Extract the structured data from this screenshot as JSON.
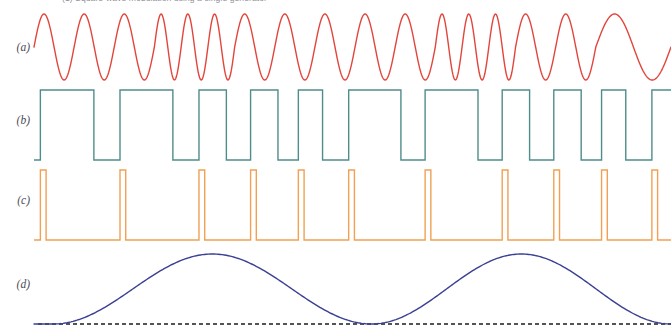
{
  "figure": {
    "clipped_top_caption": "(1)  Square-wave modulation using a single generator",
    "background_color": "#ffffff",
    "width": 671,
    "height": 330
  },
  "traces": [
    {
      "id": "a",
      "label": "(a)",
      "name": "fsk-carrier-waveform",
      "color": "#e2453c",
      "type": "sine-fsk",
      "stroke_width": 1.4,
      "label_x": 14,
      "label_y": 41,
      "row_top": 8,
      "row_height": 78
    },
    {
      "id": "b",
      "label": "(b)",
      "name": "square-wave-data-signal",
      "color": "#4f8d8b",
      "type": "square",
      "stroke_width": 1.4,
      "label_x": 14,
      "label_y": 121,
      "row_top": 86,
      "row_height": 78
    },
    {
      "id": "c",
      "label": "(c)",
      "name": "clock-spike-pulse-train",
      "color": "#f0a154",
      "type": "narrow-pulse",
      "stroke_width": 1.4,
      "label_x": 14,
      "label_y": 201,
      "row_top": 166,
      "row_height": 78
    },
    {
      "id": "d",
      "label": "(d)",
      "name": "raised-cosine-envelope",
      "color": "#3b4093",
      "baseline_color": "#1d1d1d",
      "baseline_style": "dashed",
      "type": "raised-cosine",
      "stroke_width": 1.4,
      "label_x": 14,
      "label_y": 285,
      "row_top": 246,
      "row_height": 84
    }
  ],
  "chart_data": {
    "type": "line",
    "title": "",
    "xlabel": "",
    "ylabel": "",
    "grid": false,
    "legend": "none",
    "x_range": [
      0,
      100
    ],
    "series": [
      {
        "name": "(a) FSK carrier",
        "color": "#e2453c",
        "type": "sine-fsk",
        "description": "Sinusoidal carrier whose instantaneous frequency steps between a low and a high value; amplitude constant",
        "amplitude": 1.0,
        "segment_cycles": [
          1.0,
          1.0,
          1.0,
          1.5,
          1.5,
          1.0,
          1.0,
          1.0,
          1.0,
          1.0,
          1.5,
          1.5,
          1.0,
          1.0,
          1.0
        ],
        "segment_boundaries_pct": [
          0,
          6.3,
          12.6,
          18.9,
          25.2,
          31.5,
          37.8,
          44.1,
          50.4,
          56.7,
          63.0,
          69.3,
          75.6,
          81.9,
          88.2,
          100
        ],
        "peaks_count": 16,
        "ylim": [
          -1,
          1
        ]
      },
      {
        "name": "(b) Square-wave data",
        "color": "#4f8d8b",
        "type": "square",
        "description": "Binary NRZ square wave; high and low intervals of varying width corresponding to the data bits",
        "levels": [
          0,
          1
        ],
        "ylim": [
          0,
          1
        ],
        "transitions_pct": [
          1.0,
          9.4,
          13.5,
          21.8,
          25.9,
          30.2,
          34.0,
          38.3,
          41.5,
          45.3,
          49.4,
          57.6,
          61.4,
          69.7,
          73.5,
          77.8,
          81.6,
          85.9,
          89.1,
          92.9,
          97.0
        ],
        "pulse_widths_pct": [
          8.4,
          4.1,
          8.3,
          4.1,
          4.3,
          3.8,
          4.3,
          3.2,
          3.8,
          4.1,
          8.2,
          3.8,
          8.3,
          3.8,
          4.3,
          3.8,
          4.3,
          3.2,
          3.8,
          4.1,
          3.0
        ],
        "bit_sequence": [
          1,
          0,
          1,
          0,
          1,
          0,
          1,
          0,
          1,
          0,
          1,
          0,
          1,
          0,
          1,
          0,
          1,
          0,
          1,
          0,
          1
        ]
      },
      {
        "name": "(c) Clock spikes",
        "color": "#f0a154",
        "type": "narrow-pulse",
        "description": "Very narrow positive pulses aligned with the rising edges of trace (b); used as sampling or trigger instants",
        "levels": [
          0,
          1
        ],
        "ylim": [
          0,
          1
        ],
        "pulse_width_pct": 0.9,
        "pulse_positions_pct": [
          1.0,
          13.5,
          25.9,
          34.0,
          41.5,
          49.4,
          61.4,
          73.5,
          81.6,
          89.1,
          97.0
        ],
        "pulse_count": 11
      },
      {
        "name": "(d) Raised-cosine envelope",
        "color": "#3b4093",
        "type": "raised-cosine",
        "description": "Slow low-frequency raised-cosine (half-sine squared) envelope; two full humps across the record, returning to the dashed zero baseline between them",
        "baseline_value": 0,
        "amplitude": 1.0,
        "ylim": [
          0,
          1
        ],
        "cycles": 2,
        "peak_positions_pct": [
          28,
          78
        ],
        "null_positions_pct": [
          3,
          53,
          100
        ],
        "baseline_dash_pattern": "4 3"
      }
    ]
  }
}
